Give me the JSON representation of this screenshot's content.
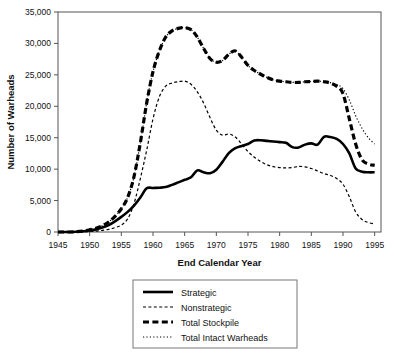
{
  "chart_data": {
    "type": "line",
    "title": "",
    "xlabel": "End Calendar Year",
    "ylabel": "Number of Warheads",
    "xlim": [
      1945,
      1996
    ],
    "ylim": [
      0,
      35000
    ],
    "xticks": [
      1945,
      1950,
      1955,
      1960,
      1965,
      1970,
      1975,
      1980,
      1985,
      1990,
      1995
    ],
    "yticks": [
      0,
      5000,
      10000,
      15000,
      20000,
      25000,
      30000,
      35000
    ],
    "ytick_labels": [
      "0",
      "5,000",
      "10,000",
      "15,000",
      "20,000",
      "25,000",
      "30,000",
      "35,000"
    ],
    "xtick_labels": [
      "1945",
      "1950",
      "1955",
      "1960",
      "1965",
      "1970",
      "1975",
      "1980",
      "1985",
      "1990",
      "1995"
    ],
    "grid": false,
    "legend_position": "below",
    "x": [
      1945,
      1946,
      1947,
      1948,
      1949,
      1950,
      1951,
      1952,
      1953,
      1954,
      1955,
      1956,
      1957,
      1958,
      1959,
      1960,
      1961,
      1962,
      1963,
      1964,
      1965,
      1966,
      1967,
      1968,
      1969,
      1970,
      1971,
      1972,
      1973,
      1974,
      1975,
      1976,
      1977,
      1978,
      1979,
      1980,
      1981,
      1982,
      1983,
      1984,
      1985,
      1986,
      1987,
      1988,
      1989,
      1990,
      1991,
      1992,
      1993,
      1994,
      1995
    ],
    "series": [
      {
        "name": "Strategic",
        "style": "solid",
        "width": 2.6,
        "values": [
          0,
          0,
          0,
          50,
          120,
          250,
          420,
          700,
          1100,
          1700,
          2400,
          3200,
          4200,
          5500,
          6950,
          7000,
          7050,
          7150,
          7500,
          7900,
          8300,
          8700,
          9800,
          9500,
          9350,
          9900,
          11200,
          12600,
          13350,
          13700,
          14000,
          14550,
          14600,
          14500,
          14400,
          14300,
          14200,
          13500,
          13450,
          13900,
          14100,
          13900,
          15150,
          15100,
          14800,
          14000,
          12500,
          10100,
          9600,
          9500,
          9500
        ]
      },
      {
        "name": "Nonstrategic",
        "style": "dashed-short",
        "width": 1.2,
        "values": [
          0,
          0,
          0,
          0,
          30,
          80,
          150,
          260,
          420,
          700,
          1100,
          2100,
          4500,
          8500,
          13000,
          18000,
          21500,
          23200,
          23700,
          23900,
          24000,
          23500,
          22300,
          20500,
          18200,
          16200,
          15400,
          15600,
          15100,
          14000,
          12800,
          11900,
          11200,
          10700,
          10400,
          10250,
          10200,
          10250,
          10450,
          10350,
          10100,
          9700,
          9300,
          9000,
          8500,
          7600,
          5600,
          3200,
          2000,
          1500,
          1300
        ]
      },
      {
        "name": "Total Stockpile",
        "style": "dashed-long",
        "width": 3.2,
        "values": [
          0,
          0,
          0,
          50,
          170,
          360,
          610,
          1000,
          1600,
          2500,
          3700,
          5500,
          8800,
          14200,
          20500,
          25500,
          28800,
          31000,
          32000,
          32400,
          32500,
          32200,
          31000,
          29200,
          27600,
          27000,
          27300,
          28300,
          28800,
          27800,
          26500,
          25700,
          25100,
          24600,
          24200,
          24000,
          23900,
          23800,
          23800,
          23900,
          23950,
          24000,
          23900,
          23700,
          23200,
          22000,
          18000,
          14000,
          11500,
          10800,
          10600
        ]
      },
      {
        "name": "Total Intact Warheads",
        "style": "dotted",
        "width": 1.2,
        "values": [
          0,
          0,
          0,
          50,
          170,
          360,
          610,
          1000,
          1600,
          2500,
          3700,
          5500,
          8800,
          14200,
          20500,
          25500,
          28800,
          31000,
          32000,
          32400,
          32500,
          32200,
          31000,
          29200,
          27600,
          27000,
          27300,
          28300,
          28800,
          27800,
          26500,
          25700,
          25100,
          24600,
          24200,
          24000,
          23900,
          23800,
          23800,
          23900,
          23950,
          24000,
          23900,
          23750,
          23500,
          22800,
          21000,
          18500,
          16500,
          15000,
          14000
        ]
      }
    ],
    "legend": [
      {
        "label": "Strategic",
        "style": "solid"
      },
      {
        "label": "Nonstrategic",
        "style": "dashed-short"
      },
      {
        "label": "Total Stockpile",
        "style": "dashed-long"
      },
      {
        "label": "Total Intact Warheads",
        "style": "dotted"
      }
    ],
    "colors": {
      "line": "#000000",
      "axis": "#555555",
      "text": "#111111",
      "legend_border": "#777777"
    }
  }
}
